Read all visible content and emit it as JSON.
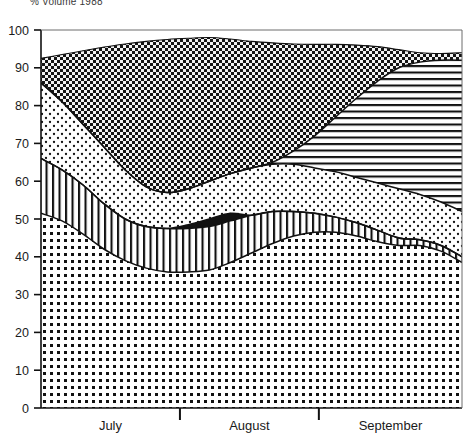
{
  "chart_data": {
    "type": "area",
    "title": "% Volume 1988",
    "xlabel": "",
    "ylabel": "",
    "ylim": [
      0,
      100
    ],
    "yticks": [
      0,
      10,
      20,
      30,
      40,
      50,
      60,
      70,
      80,
      90,
      100
    ],
    "ytick_labels": [
      "0",
      "10",
      "20",
      "30",
      "40",
      "50",
      "60",
      "70",
      "80",
      "90",
      "100"
    ],
    "xtick_labels": [
      "July",
      "August",
      "September"
    ],
    "x_divider_positions": [
      0.33,
      0.66
    ],
    "grid": false,
    "legend": "none",
    "stacked": true,
    "x": [
      0,
      0.05,
      0.1,
      0.15,
      0.2,
      0.25,
      0.3,
      0.35,
      0.4,
      0.45,
      0.5,
      0.55,
      0.6,
      0.65,
      0.7,
      0.75,
      0.8,
      0.85,
      0.9,
      0.95,
      1.0
    ],
    "series": [
      {
        "name": "band-1-dense-dots",
        "fill": "dense-dots",
        "cumulative_top": [
          51.5,
          49.5,
          46.0,
          42.0,
          39.0,
          37.0,
          36.0,
          36.0,
          36.5,
          38.5,
          41.0,
          43.5,
          45.5,
          46.5,
          46.5,
          45.5,
          44.0,
          43.0,
          43.0,
          41.5,
          38.5
        ]
      },
      {
        "name": "band-2-vertical-lines",
        "fill": "vertical-lines",
        "cumulative_top": [
          66.0,
          63.0,
          59.0,
          54.0,
          50.0,
          48.0,
          47.5,
          47.5,
          48.0,
          49.5,
          51.0,
          52.0,
          52.0,
          51.5,
          50.5,
          49.0,
          47.0,
          45.0,
          44.5,
          43.0,
          40.0
        ]
      },
      {
        "name": "band-3-solid-black",
        "fill": "solid-black",
        "cumulative_top": [
          66.0,
          63.0,
          59.0,
          54.0,
          50.0,
          48.0,
          47.5,
          48.5,
          50.0,
          51.5,
          51.0,
          52.0,
          52.0,
          51.5,
          50.5,
          49.0,
          47.0,
          45.0,
          44.5,
          43.0,
          40.0
        ]
      },
      {
        "name": "band-4-light-dots",
        "fill": "light-dots",
        "cumulative_top": [
          86.0,
          81.0,
          75.0,
          69.0,
          63.0,
          58.5,
          57.0,
          58.0,
          60.0,
          62.0,
          63.5,
          64.5,
          64.5,
          63.5,
          62.5,
          61.0,
          59.5,
          58.0,
          56.5,
          54.5,
          52.0
        ]
      },
      {
        "name": "band-5-horizontal-lines",
        "fill": "horizontal-lines",
        "cumulative_top": [
          86.0,
          81.0,
          75.0,
          69.0,
          63.0,
          58.5,
          57.0,
          58.0,
          60.0,
          62.0,
          63.5,
          65.0,
          68.0,
          72.0,
          77.0,
          82.0,
          86.5,
          90.0,
          91.5,
          92.0,
          92.0
        ]
      },
      {
        "name": "band-6-dark-checker",
        "fill": "dark-checker",
        "cumulative_top": [
          92.5,
          93.5,
          94.5,
          95.5,
          96.3,
          97.0,
          97.5,
          97.8,
          98.0,
          97.6,
          97.0,
          96.6,
          96.3,
          96.2,
          96.2,
          96.0,
          95.6,
          94.8,
          94.0,
          93.8,
          94.0
        ]
      }
    ]
  },
  "axes": {
    "y_axis_name": "percent-axis",
    "x_axis_name": "month-axis"
  }
}
